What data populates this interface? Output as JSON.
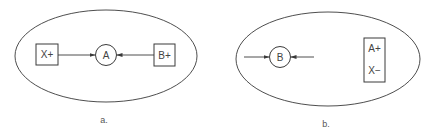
{
  "colors": {
    "stroke": "#3a3a3a",
    "text": "#444444",
    "background": "#ffffff"
  },
  "panels": [
    {
      "caption": "a.",
      "nodes": [
        {
          "id": "x_plus",
          "shape": "square",
          "label": "X+"
        },
        {
          "id": "a",
          "shape": "circle",
          "label": "A"
        },
        {
          "id": "b_plus",
          "shape": "square",
          "label": "B+"
        }
      ],
      "edges": [
        {
          "from": "x_plus",
          "to": "a",
          "arrow": "end"
        },
        {
          "from": "b_plus",
          "to": "a",
          "arrow": "end"
        }
      ],
      "container": "ellipse"
    },
    {
      "caption": "b.",
      "nodes": [
        {
          "id": "b",
          "shape": "circle",
          "label": "B"
        },
        {
          "id": "ax_box",
          "shape": "rectangle",
          "labels": [
            "A+",
            "X−"
          ]
        }
      ],
      "edges": [
        {
          "from": "left-external",
          "to": "b",
          "arrow": "end"
        },
        {
          "from": "right-external",
          "to": "b",
          "arrow": "end"
        }
      ],
      "container": "ellipse"
    }
  ],
  "text": {
    "a_x_plus": "X+",
    "a_circle": "A",
    "a_b_plus": "B+",
    "a_caption": "a.",
    "b_circle": "B",
    "b_box_top": "A+",
    "b_box_bottom": "X−",
    "b_caption": "b."
  }
}
